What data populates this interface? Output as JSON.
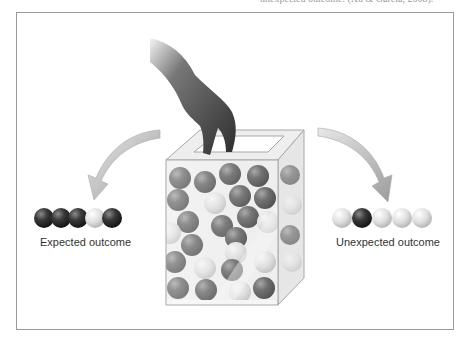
{
  "caption_top": "unexpected outcome. (Xu & Garcia, 2008).",
  "labels": {
    "expected": "Expected outcome",
    "unexpected": "Unexpected outcome"
  },
  "outcomes": {
    "expected": [
      "dark",
      "dark",
      "dark",
      "light",
      "dark"
    ],
    "unexpected": [
      "light",
      "dark",
      "light",
      "light",
      "light"
    ]
  },
  "colors": {
    "dark_ball": "#3a3a3a",
    "light_ball": "#dcdcdc",
    "arrow": "#b0b0b0",
    "frame_border": "#9a9a9a"
  }
}
